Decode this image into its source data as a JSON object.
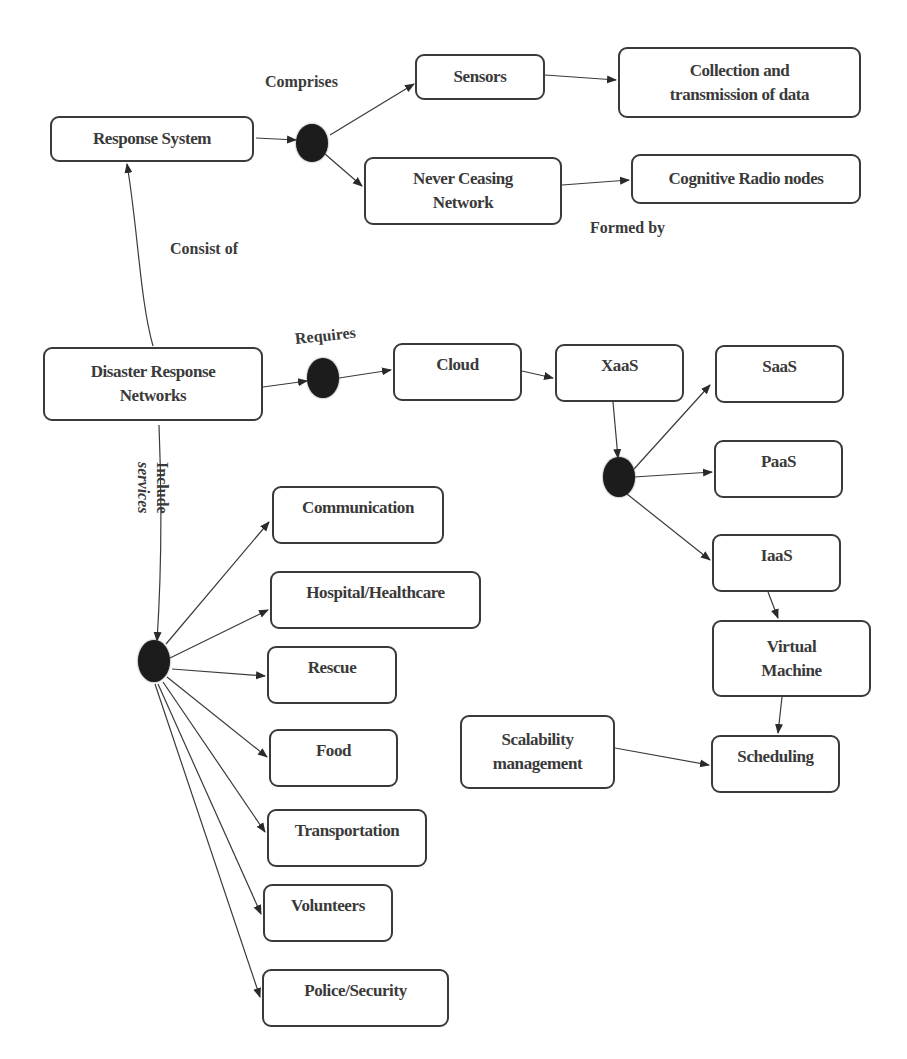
{
  "diagram": {
    "nodes": {
      "response_system": "Response System",
      "sensors": "Sensors",
      "collection_line1": "Collection and",
      "collection_line2": "transmission of data",
      "never_ceasing_line1": "Never Ceasing",
      "never_ceasing_line2": "Network",
      "cognitive_radio": "Cognitive Radio nodes",
      "drn_line1": "Disaster Response",
      "drn_line2": "Networks",
      "cloud": "Cloud",
      "xaas": "XaaS",
      "saas": "SaaS",
      "paas": "PaaS",
      "iaas": "IaaS",
      "vm_line1": "Virtual",
      "vm_line2": "Machine",
      "scheduling": "Scheduling",
      "scalability_line1": "Scalability",
      "scalability_line2": "management",
      "communication": "Communication",
      "hospital": "Hospital/Healthcare",
      "rescue": "Rescue",
      "food": "Food",
      "transportation": "Transportation",
      "volunteers": "Volunteers",
      "police": "Police/Security"
    },
    "edge_labels": {
      "comprises": "Comprises",
      "formed_by": "Formed by",
      "consist_of": "Consist of",
      "requires": "Requires",
      "include_line1": "Include",
      "include_line2": "services"
    },
    "colors": {
      "stroke": "#3a3a3a",
      "junction": "#1c1c1c",
      "background": "#ffffff"
    }
  }
}
